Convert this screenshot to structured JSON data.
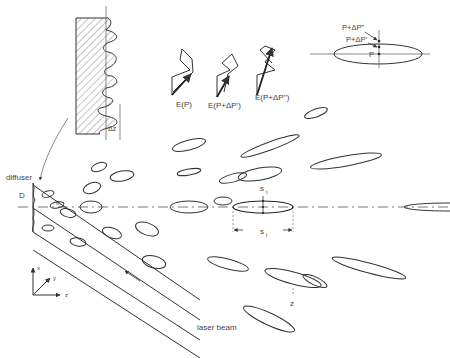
{
  "labels": {
    "diffuser": "diffuser",
    "D": "D",
    "delta_z": "Δz",
    "laser_beam": "laser beam",
    "z_axis": "z",
    "s_t": "s",
    "s_t_sub": "t",
    "s_l": "s",
    "s_l_sub": "l",
    "E_P": "E(P)",
    "E_P1": "E(P+ΔP')",
    "E_P2": "E(P+ΔP'')",
    "P": "P",
    "P1": "P+ΔP'",
    "P2": "P+ΔP''",
    "coord_x": "x",
    "coord_y": "y",
    "coord_z": "z",
    "theta": "θ"
  },
  "colors": {
    "line": "#333333",
    "text": "#444444",
    "background": "#ffffff"
  }
}
